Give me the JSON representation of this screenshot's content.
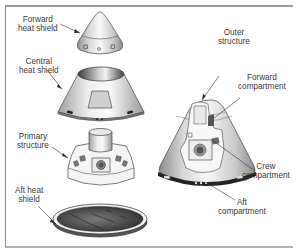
{
  "diagram": {
    "type": "exploded-view",
    "colors": {
      "frame": "#9a9a9a",
      "text": "#3a3a3a",
      "metal_light": "#f2f2f2",
      "metal_dark": "#8c8c8c",
      "heat_shield_dark": "#4a4a4a"
    },
    "labels": {
      "forward_heat_shield": {
        "line1": "Forward",
        "line2": "heat shield"
      },
      "central_heat_shield": {
        "line1": "Central",
        "line2": "heat shield"
      },
      "primary_structure": {
        "line1": "Primary",
        "line2": "structure"
      },
      "aft_heat_shield": {
        "line1": "Aft heat",
        "line2": "shield"
      },
      "outer_structure": {
        "line1": "Outer",
        "line2": "structure"
      },
      "forward_compartment": {
        "line1": "Forward",
        "line2": "compartment"
      },
      "crew_compartment": {
        "line1": "Crew",
        "line2": "compartment"
      },
      "aft_compartment": {
        "line1": "Aft",
        "line2": "compartment"
      }
    }
  }
}
